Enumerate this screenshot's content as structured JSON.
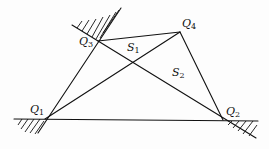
{
  "diagram": {
    "type": "geometry-quadrilateral",
    "points": {
      "Q1": {
        "label": "Q",
        "sub": "1",
        "x": 45,
        "y": 119
      },
      "Q2": {
        "label": "Q",
        "sub": "2",
        "x": 223,
        "y": 120
      },
      "Q3": {
        "label": "Q",
        "sub": "3",
        "x": 98,
        "y": 41
      },
      "Q4": {
        "label": "Q",
        "sub": "4",
        "x": 180,
        "y": 32
      }
    },
    "regions": {
      "S1": {
        "label": "S",
        "sub": "1"
      },
      "S2": {
        "label": "S",
        "sub": "2"
      }
    },
    "edges": [
      "Q1-Q2",
      "Q1-Q3",
      "Q3-Q4",
      "Q4-Q2",
      "Q1-Q4",
      "Q3-Q2"
    ],
    "constraints": [
      "ground line through Q1 and Q2 (hatched below)",
      "hatched wedge at Q3",
      "hatched wedge at Q1",
      "hatched wedge at Q2"
    ],
    "colors": {
      "stroke": "#111111",
      "background": "#fdfdfd"
    }
  }
}
